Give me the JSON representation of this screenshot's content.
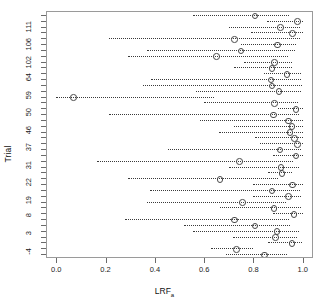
{
  "chart_data": {
    "type": "scatter",
    "title": "",
    "subtitle": "",
    "xlabel": "LRF",
    "xlabel_sub": "a",
    "ylabel": "Trial",
    "xlim": [
      0.0,
      1.0
    ],
    "grid": false,
    "legend": null,
    "annotations": [],
    "xticks": [
      0.0,
      0.2,
      0.4,
      0.6,
      0.8,
      1.0
    ],
    "xticklabels": [
      "0.0",
      "0.2",
      "0.4",
      "0.6",
      "0.8",
      "1.0"
    ],
    "yticklabels": [
      "111",
      "106",
      "102",
      "64",
      "59",
      "50",
      "46",
      "37",
      "31",
      "22",
      "19",
      "8",
      "3",
      "-4"
    ],
    "ytick_label_rows": [
      1,
      4,
      7,
      10,
      13,
      16,
      19,
      22,
      25,
      28,
      31,
      34,
      37,
      40
    ],
    "n_rows": 42,
    "marker": "open-circle",
    "interval_style": "dotted",
    "points": [
      {
        "trial": "111",
        "estimate": 0.803,
        "low": 0.553,
        "high": 0.945
      },
      {
        "trial": "",
        "estimate": 0.975,
        "low": 0.855,
        "high": 1.0
      },
      {
        "trial": "106",
        "estimate": 0.905,
        "low": 0.7,
        "high": 0.99
      },
      {
        "trial": "",
        "estimate": 0.955,
        "low": 0.79,
        "high": 1.0
      },
      {
        "trial": "",
        "estimate": 0.718,
        "low": 0.212,
        "high": 0.988
      },
      {
        "trial": "102",
        "estimate": 0.893,
        "low": 0.75,
        "high": 0.972
      },
      {
        "trial": "",
        "estimate": 0.745,
        "low": 0.37,
        "high": 0.97
      },
      {
        "trial": "",
        "estimate": 0.645,
        "low": 0.29,
        "high": 0.94
      },
      {
        "trial": "64",
        "estimate": 0.882,
        "low": 0.76,
        "high": 0.955
      },
      {
        "trial": "",
        "estimate": 0.872,
        "low": 0.722,
        "high": 0.958
      },
      {
        "trial": "",
        "estimate": 0.932,
        "low": 0.842,
        "high": 0.995
      },
      {
        "trial": "59",
        "estimate": 0.868,
        "low": 0.385,
        "high": 0.995
      },
      {
        "trial": "",
        "estimate": 0.872,
        "low": 0.352,
        "high": 0.998
      },
      {
        "trial": "",
        "estimate": 0.9,
        "low": 0.565,
        "high": 0.995
      },
      {
        "trial": "50",
        "estimate": 0.065,
        "low": 0.0,
        "high": 0.64
      },
      {
        "trial": "",
        "estimate": 0.882,
        "low": 0.6,
        "high": 0.98
      },
      {
        "trial": "",
        "estimate": 0.968,
        "low": 0.9,
        "high": 1.0
      },
      {
        "trial": "46",
        "estimate": 0.878,
        "low": 0.215,
        "high": 0.985
      },
      {
        "trial": "",
        "estimate": 0.938,
        "low": 0.585,
        "high": 1.0
      },
      {
        "trial": "",
        "estimate": 0.952,
        "low": 0.72,
        "high": 1.0
      },
      {
        "trial": "37",
        "estimate": 0.945,
        "low": 0.66,
        "high": 1.0
      },
      {
        "trial": "",
        "estimate": 0.962,
        "low": 0.805,
        "high": 1.0
      },
      {
        "trial": "",
        "estimate": 0.975,
        "low": 0.828,
        "high": 1.0
      },
      {
        "trial": "31",
        "estimate": 0.903,
        "low": 0.452,
        "high": 0.992
      },
      {
        "trial": "",
        "estimate": 0.968,
        "low": 0.88,
        "high": 1.0
      },
      {
        "trial": "",
        "estimate": 0.74,
        "low": 0.165,
        "high": 0.962
      },
      {
        "trial": "22",
        "estimate": 0.908,
        "low": 0.7,
        "high": 0.985
      },
      {
        "trial": "",
        "estimate": 0.912,
        "low": 0.86,
        "high": 0.955
      },
      {
        "trial": "",
        "estimate": 0.66,
        "low": 0.29,
        "high": 0.898
      },
      {
        "trial": "19",
        "estimate": 0.955,
        "low": 0.8,
        "high": 1.0
      },
      {
        "trial": "",
        "estimate": 0.872,
        "low": 0.382,
        "high": 0.99
      },
      {
        "trial": "",
        "estimate": 0.938,
        "low": 0.8,
        "high": 0.995
      },
      {
        "trial": "8",
        "estimate": 0.752,
        "low": 0.37,
        "high": 0.932
      },
      {
        "trial": "",
        "estimate": 0.88,
        "low": 0.665,
        "high": 0.992
      },
      {
        "trial": "",
        "estimate": 0.96,
        "low": 0.88,
        "high": 1.0
      },
      {
        "trial": "3",
        "estimate": 0.718,
        "low": 0.28,
        "high": 0.945
      },
      {
        "trial": "",
        "estimate": 0.802,
        "low": 0.52,
        "high": 0.95
      },
      {
        "trial": "",
        "estimate": 0.892,
        "low": 0.555,
        "high": 0.985
      },
      {
        "trial": "",
        "estimate": 0.885,
        "low": 0.718,
        "high": 0.975
      },
      {
        "trial": "-4",
        "estimate": 0.952,
        "low": 0.86,
        "high": 0.998
      },
      {
        "trial": "",
        "estimate": 0.728,
        "low": 0.628,
        "high": 0.8
      },
      {
        "trial": "",
        "estimate": 0.84,
        "low": 0.69,
        "high": 0.935
      }
    ]
  }
}
